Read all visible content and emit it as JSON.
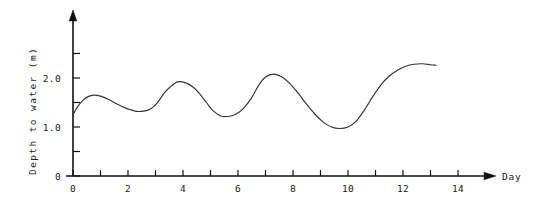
{
  "chart_data": {
    "type": "line",
    "title": "",
    "xlabel": "Day",
    "ylabel": "Depth to water  (m)",
    "xlim": [
      0,
      15
    ],
    "ylim": [
      0,
      2.6
    ],
    "grid": false,
    "legend": "none",
    "x_ticks_all": [
      0,
      1,
      2,
      3,
      4,
      5,
      6,
      7,
      8,
      9,
      10,
      11,
      12,
      13,
      14
    ],
    "x_tick_labels": [
      "0",
      "2",
      "4",
      "6",
      "8",
      "10",
      "12",
      "14"
    ],
    "x_tick_label_values": [
      0,
      2,
      4,
      6,
      8,
      10,
      12,
      14
    ],
    "y_ticks_all": [
      0,
      0.5,
      1.0,
      1.5,
      2.0,
      2.5
    ],
    "y_tick_labels": [
      "0",
      "1.0",
      "2.0"
    ],
    "y_tick_label_values": [
      0,
      1.0,
      2.0
    ],
    "series": [
      {
        "name": "Depth to water",
        "x": [
          0.0,
          0.15,
          0.35,
          0.55,
          0.75,
          1.0,
          1.3,
          1.6,
          1.9,
          2.1,
          2.3,
          2.5,
          2.7,
          2.9,
          3.1,
          3.3,
          3.5,
          3.8,
          4.1,
          4.35,
          4.6,
          4.85,
          5.1,
          5.4,
          5.7,
          5.95,
          6.2,
          6.5,
          6.75,
          7.0,
          7.3,
          7.6,
          7.9,
          8.2,
          8.5,
          8.8,
          9.1,
          9.4,
          9.7,
          10.0,
          10.3,
          10.6,
          10.9,
          11.2,
          11.5,
          11.8,
          12.1,
          12.4,
          12.7,
          13.0,
          13.2
        ],
        "y": [
          1.25,
          1.4,
          1.54,
          1.62,
          1.65,
          1.63,
          1.56,
          1.47,
          1.39,
          1.35,
          1.32,
          1.32,
          1.34,
          1.4,
          1.52,
          1.68,
          1.8,
          1.92,
          1.9,
          1.82,
          1.68,
          1.5,
          1.33,
          1.22,
          1.22,
          1.27,
          1.38,
          1.6,
          1.85,
          2.02,
          2.08,
          2.02,
          1.88,
          1.68,
          1.46,
          1.26,
          1.1,
          1.0,
          0.97,
          1.0,
          1.12,
          1.35,
          1.62,
          1.86,
          2.04,
          2.16,
          2.24,
          2.28,
          2.29,
          2.27,
          2.26
        ]
      }
    ],
    "annotations": {
      "x_axis_arrow": true,
      "y_axis_arrow": true
    }
  },
  "axis_labels": {
    "x_title": "Day",
    "y_title": "Depth to water  (m)"
  }
}
